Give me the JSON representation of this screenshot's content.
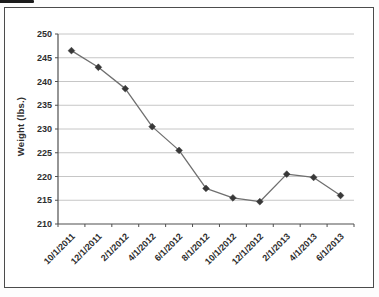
{
  "chart_data": {
    "type": "line",
    "ylabel": "Weight (lbs.)",
    "xlabel": "",
    "categories": [
      "10/1/2011",
      "12/1/2011",
      "2/1/2012",
      "4/1/2012",
      "6/1/2012",
      "8/1/2012",
      "10/1/2012",
      "12/1/2012",
      "2/1/2013",
      "4/1/2013",
      "6/1/2013"
    ],
    "series": [
      {
        "name": "Weight",
        "values": [
          246.5,
          243,
          238.5,
          230.5,
          225.5,
          217.5,
          215.5,
          214.7,
          220.5,
          219.8,
          216
        ]
      }
    ],
    "ylim": [
      210,
      250
    ],
    "yticks": [
      210,
      215,
      220,
      225,
      230,
      235,
      240,
      245,
      250
    ],
    "grid": true,
    "legend_position": "none",
    "marker": "diamond",
    "x_label_rotation_deg": 45,
    "colors": {
      "line": "#6f6f6f",
      "marker": "#383838",
      "gridline": "#c6c6c6",
      "axis": "#4f4f4f",
      "tick_label": "#2e2e2e",
      "frame_border": "#4b4b4b",
      "background": "#ffffff"
    }
  }
}
